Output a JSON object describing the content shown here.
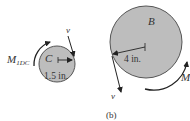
{
  "figure": {
    "caption": "(b)",
    "colors": {
      "disk_fill": "#bdbdbd",
      "disk_stroke": "#444444",
      "ink": "#222222",
      "background": "#ffffff"
    },
    "disk_c": {
      "label": "C",
      "radius_label": "1.5 in.",
      "moment_label_main": "M",
      "moment_label_sub": "1DC",
      "velocity_label": "v"
    },
    "disk_b": {
      "label": "B",
      "radius_label": "4 in.",
      "moment_label": "M",
      "velocity_label": "v"
    }
  }
}
